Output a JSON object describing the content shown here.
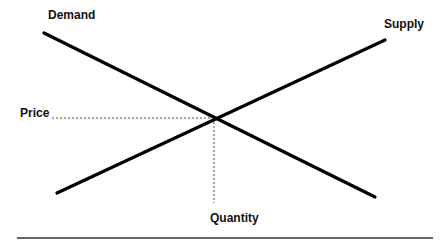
{
  "diagram": {
    "type": "supply-demand",
    "labels": {
      "demand": "Demand",
      "supply": "Supply",
      "price": "Price",
      "quantity": "Quantity"
    },
    "lines": {
      "demand": {
        "x1": 44,
        "y1": 33,
        "x2": 375,
        "y2": 197
      },
      "supply": {
        "x1": 57,
        "y1": 193,
        "x2": 385,
        "y2": 40
      }
    },
    "equilibrium": {
      "x": 216,
      "y": 118
    },
    "colors": {
      "line": "#000000",
      "text": "#111111",
      "rule": "#333333"
    }
  }
}
